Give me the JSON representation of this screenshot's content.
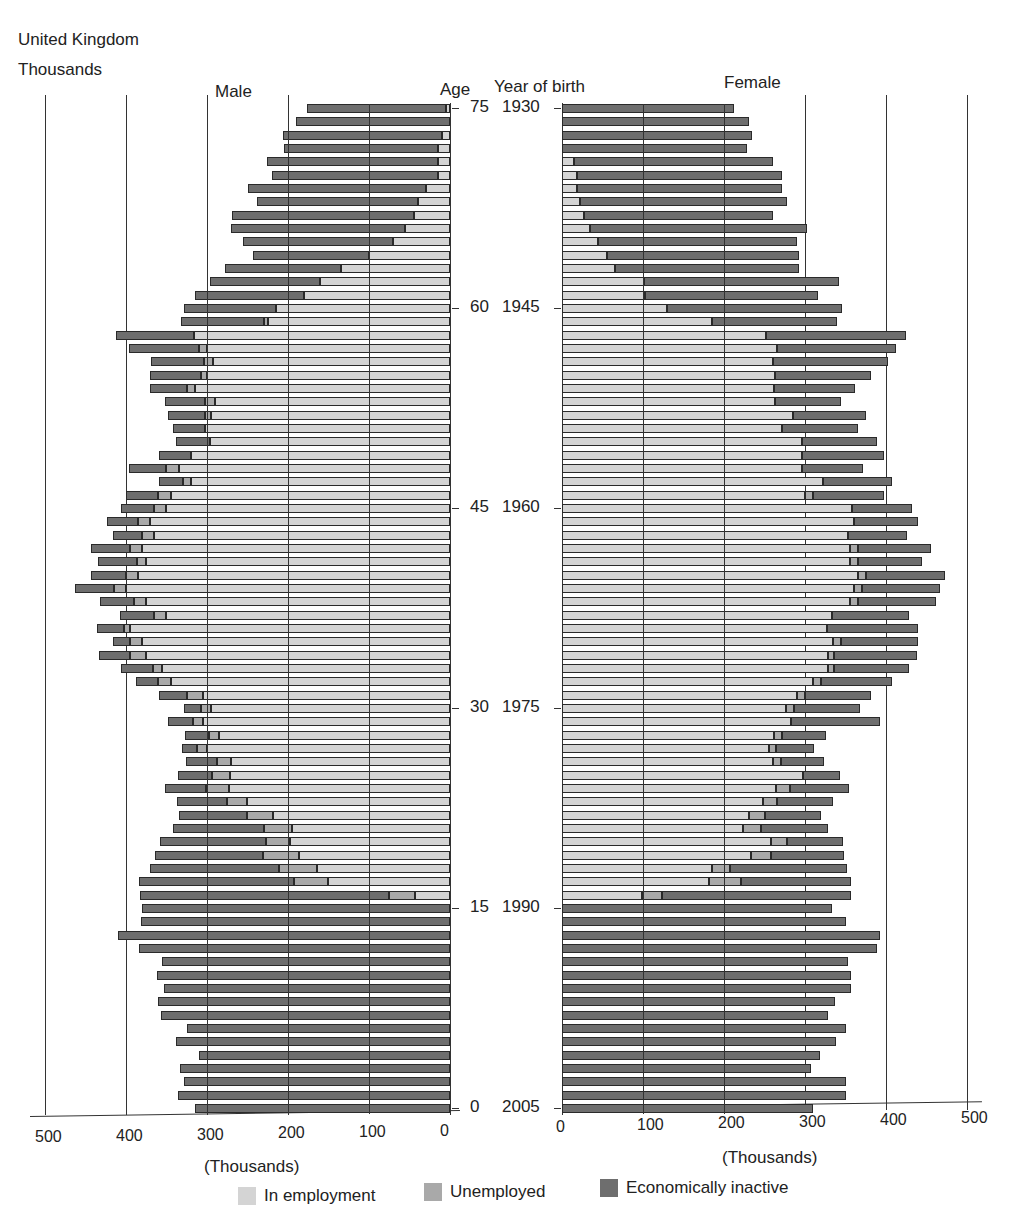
{
  "header": {
    "region": "United Kingdom",
    "unit": "Thousands",
    "male_label": "Male",
    "female_label": "Female",
    "age_label": "Age",
    "yob_label": "Year of birth"
  },
  "axis": {
    "male_ticks": [
      "500",
      "400",
      "300",
      "200",
      "100",
      "0"
    ],
    "female_ticks": [
      "0",
      "100",
      "200",
      "300",
      "400",
      "500"
    ],
    "male_xlabel": "(Thousands)",
    "female_xlabel": "(Thousands)",
    "age_ticks": [
      "75",
      "60",
      "45",
      "30",
      "15",
      "0"
    ],
    "yob_ticks": [
      "1930",
      "1945",
      "1960",
      "1975",
      "1990",
      "2005"
    ]
  },
  "legend": {
    "employment": "In employment",
    "unemployed": "Unemployed",
    "inactive": "Economically inactive"
  },
  "colors": {
    "employment": "#d4d4d4",
    "unemployed": "#a9a9a9",
    "inactive": "#6e6e6e"
  },
  "chart_data": {
    "type": "bar",
    "subtype": "population pyramid (stacked horizontal bars)",
    "title": "United Kingdom",
    "unit": "Thousands",
    "xlabel": "(Thousands)",
    "ylabel_left": "Age",
    "ylabel_right": "Year of birth",
    "xlim": [
      0,
      500
    ],
    "grid": true,
    "legend": [
      "In employment",
      "Unemployed",
      "Economically inactive"
    ],
    "legend_position": "bottom",
    "ages": [
      75,
      74,
      73,
      72,
      71,
      70,
      69,
      68,
      67,
      66,
      65,
      64,
      63,
      62,
      61,
      60,
      59,
      58,
      57,
      56,
      55,
      54,
      53,
      52,
      51,
      50,
      49,
      48,
      47,
      46,
      45,
      44,
      43,
      42,
      41,
      40,
      39,
      38,
      37,
      36,
      35,
      34,
      33,
      32,
      31,
      30,
      29,
      28,
      27,
      26,
      25,
      24,
      23,
      22,
      21,
      20,
      19,
      18,
      17,
      16,
      15,
      14,
      13,
      12,
      11,
      10,
      9,
      8,
      7,
      6,
      5,
      4,
      3,
      2,
      1,
      0
    ],
    "male": {
      "total": [
        176,
        190,
        206,
        205,
        226,
        220,
        250,
        238,
        269,
        270,
        255,
        243,
        278,
        296,
        315,
        328,
        332,
        412,
        396,
        369,
        370,
        370,
        352,
        348,
        342,
        338,
        359,
        396,
        359,
        400,
        406,
        423,
        416,
        443,
        434,
        443,
        463,
        432,
        407,
        436,
        416,
        433,
        406,
        388,
        359,
        328,
        348,
        327,
        331,
        326,
        336,
        352,
        337,
        335,
        342,
        358,
        364,
        370,
        384,
        383,
        380,
        382,
        410,
        384,
        355,
        362,
        353,
        360,
        357,
        325,
        338,
        310,
        333,
        328,
        336,
        315
      ],
      "unemployed": [
        0,
        0,
        0,
        0,
        0,
        0,
        0,
        0,
        0,
        0,
        0,
        0,
        0,
        0,
        0,
        0,
        5,
        0,
        10,
        12,
        8,
        10,
        12,
        8,
        0,
        0,
        0,
        15,
        10,
        15,
        15,
        15,
        15,
        15,
        12,
        15,
        15,
        15,
        15,
        8,
        15,
        20,
        12,
        15,
        20,
        12,
        12,
        12,
        12,
        18,
        22,
        28,
        25,
        32,
        35,
        30,
        45,
        47,
        42,
        32,
        0,
        0,
        0,
        0,
        0,
        0,
        0,
        0,
        0,
        0,
        0,
        0,
        0,
        0,
        0,
        0
      ],
      "employed": [
        5,
        0,
        10,
        15,
        15,
        15,
        30,
        40,
        45,
        55,
        70,
        100,
        135,
        160,
        180,
        215,
        225,
        316,
        300,
        292,
        300,
        315,
        290,
        295,
        302,
        296,
        320,
        335,
        320,
        345,
        350,
        370,
        365,
        380,
        375,
        385,
        400,
        375,
        350,
        395,
        380,
        375,
        355,
        345,
        305,
        295,
        305,
        285,
        300,
        270,
        272,
        273,
        250,
        218,
        195,
        197,
        186,
        164,
        150,
        43,
        0,
        0,
        0,
        0,
        0,
        0,
        0,
        0,
        0,
        0,
        0,
        0,
        0,
        0,
        0,
        0
      ]
    },
    "female": {
      "total": [
        212,
        231,
        235,
        229,
        261,
        272,
        272,
        278,
        261,
        302,
        290,
        292,
        293,
        342,
        316,
        346,
        340,
        425,
        412,
        402,
        382,
        362,
        344,
        375,
        366,
        389,
        398,
        372,
        407,
        398,
        432,
        440,
        426,
        455,
        445,
        473,
        467,
        462,
        428,
        440,
        440,
        438,
        429,
        408,
        382,
        368,
        392,
        326,
        311,
        323,
        343,
        354,
        335,
        320,
        329,
        347,
        348,
        352,
        357,
        357,
        333,
        351,
        392,
        389,
        353,
        357,
        357,
        337,
        329,
        350,
        338,
        318,
        307,
        350,
        350,
        310
      ],
      "unemployed": [
        0,
        0,
        0,
        0,
        0,
        0,
        0,
        0,
        0,
        0,
        0,
        0,
        0,
        0,
        0,
        0,
        0,
        0,
        0,
        0,
        0,
        0,
        0,
        0,
        0,
        0,
        0,
        0,
        0,
        10,
        0,
        0,
        0,
        10,
        10,
        10,
        10,
        10,
        0,
        0,
        10,
        8,
        8,
        10,
        10,
        10,
        0,
        10,
        8,
        10,
        0,
        18,
        17,
        20,
        22,
        20,
        25,
        22,
        40,
        25,
        0,
        0,
        0,
        0,
        0,
        0,
        0,
        0,
        0,
        0,
        0,
        0,
        0,
        0,
        0,
        0
      ],
      "employed": [
        0,
        0,
        0,
        0,
        15,
        18,
        18,
        22,
        27,
        35,
        44,
        56,
        66,
        101,
        103,
        130,
        185,
        252,
        265,
        260,
        263,
        262,
        263,
        285,
        272,
        296,
        296,
        296,
        322,
        300,
        358,
        360,
        353,
        355,
        355,
        365,
        360,
        356,
        333,
        327,
        335,
        328,
        328,
        310,
        290,
        277,
        283,
        262,
        256,
        260,
        297,
        264,
        248,
        231,
        224,
        258,
        233,
        185,
        181,
        99,
        0,
        0,
        0,
        0,
        0,
        0,
        0,
        0,
        0,
        0,
        0,
        0,
        0,
        0,
        0,
        0
      ]
    }
  }
}
